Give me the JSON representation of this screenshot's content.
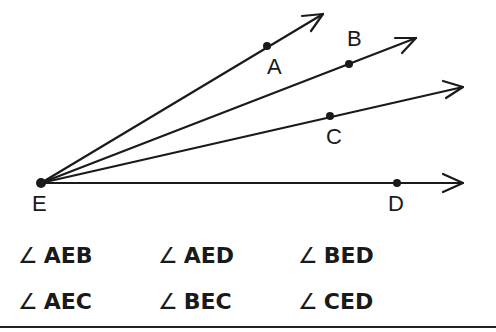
{
  "diagram": {
    "vertex": {
      "name": "E",
      "x": 41,
      "y": 183
    },
    "rays": [
      {
        "name": "EA",
        "point": {
          "label": "A",
          "x": 267,
          "y": 46
        },
        "tip": {
          "x": 323,
          "y": 14
        }
      },
      {
        "name": "EB",
        "point": {
          "label": "B",
          "x": 349,
          "y": 64
        },
        "tip": {
          "x": 416,
          "y": 38
        }
      },
      {
        "name": "EC",
        "point": {
          "label": "C",
          "x": 330,
          "y": 116
        },
        "tip": {
          "x": 463,
          "y": 87
        }
      },
      {
        "name": "ED",
        "point": {
          "label": "D",
          "x": 397,
          "y": 183
        },
        "tip": {
          "x": 463,
          "y": 183
        }
      }
    ],
    "labels": {
      "A": "A",
      "B": "B",
      "C": "C",
      "D": "D",
      "E": "E"
    }
  },
  "angles": {
    "symbol": "∠",
    "row1": [
      "AEB",
      "AED",
      "BED"
    ],
    "row2": [
      "AEC",
      "BEC",
      "CED"
    ]
  },
  "colors": {
    "ink": "#1a1a1a",
    "background": "#ffffff"
  }
}
